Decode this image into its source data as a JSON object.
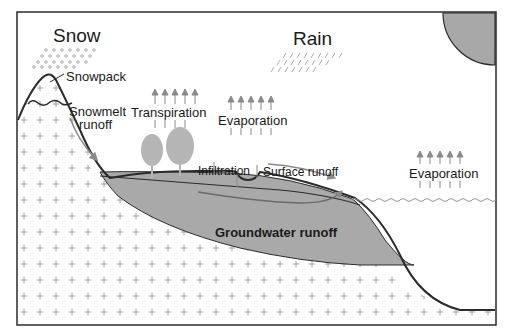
{
  "diagram": {
    "labels": {
      "snow": "Snow",
      "rain": "Rain",
      "snowpack": "Snowpack",
      "snowmelt_line1": "Snowmelt",
      "snowmelt_line2": "runoff",
      "transpiration": "Transpiration",
      "evaporation_land": "Evaporation",
      "evaporation_sea": "Evaporation",
      "infiltration": "Infiltration",
      "surface_runoff": "Surface runoff",
      "groundwater_runoff": "Groundwater runoff"
    },
    "colors": {
      "border": "#2b2b2b",
      "groundwater": "#a9a9a9",
      "sun": "#a8a8a8",
      "arrow": "#8a8a8a",
      "tree": "#b5b5b5",
      "text": "#1a1a1a"
    },
    "icons": {
      "sun": "sun-quarter-circle",
      "snow": "snow-dots",
      "rain": "rain-streaks",
      "tree": "tree-icon",
      "arrow": "upward-arrow"
    }
  }
}
